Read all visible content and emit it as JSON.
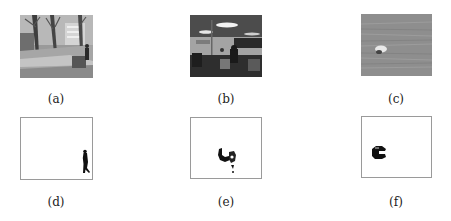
{
  "figure": {
    "panels": [
      {
        "id": "a",
        "caption": "(a)",
        "kind": "photo",
        "content": "outdoor campus walkway with bare trees and a pedestrian"
      },
      {
        "id": "b",
        "caption": "(b)",
        "kind": "photo",
        "content": "indoor office with ceiling lights and a person"
      },
      {
        "id": "c",
        "caption": "(c)",
        "kind": "photo",
        "content": "water surface with a floating object"
      },
      {
        "id": "d",
        "caption": "(d)",
        "kind": "mask",
        "content": "foreground mask: walking person at right edge"
      },
      {
        "id": "e",
        "caption": "(e)",
        "kind": "mask",
        "content": "foreground mask: person blob in center"
      },
      {
        "id": "f",
        "caption": "(f)",
        "kind": "mask",
        "content": "foreground mask: object blob at left"
      }
    ]
  }
}
